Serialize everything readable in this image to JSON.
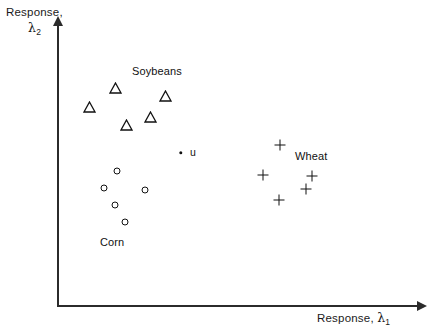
{
  "chart_data": {
    "type": "scatter",
    "title": "",
    "xlabel": "Response, λ₁",
    "ylabel": "Response, λ₂",
    "axis": {
      "x_label_text": "Response,",
      "x_label_symbol": "λ",
      "x_label_subscript": "1",
      "y_label_text": "Response,",
      "y_label_symbol": "λ",
      "y_label_subscript": "2",
      "x_has_arrow": true,
      "y_has_arrow": true,
      "ticks": [],
      "tick_labels": [],
      "grid": false,
      "xlim": [
        0,
        100
      ],
      "ylim": [
        0,
        100
      ]
    },
    "legend": {
      "position": "inline-annotations",
      "entries": [
        {
          "name": "Soybeans",
          "marker": "triangle"
        },
        {
          "name": "Corn",
          "marker": "circle"
        },
        {
          "name": "Wheat",
          "marker": "plus"
        }
      ]
    },
    "series": [
      {
        "name": "Soybeans",
        "marker": "triangle",
        "label": "Soybeans",
        "label_x": 132,
        "label_y": 65,
        "points": [
          {
            "x": 115,
            "y": 88
          },
          {
            "x": 89,
            "y": 107
          },
          {
            "x": 165,
            "y": 96
          },
          {
            "x": 150,
            "y": 117
          },
          {
            "x": 126,
            "y": 125
          }
        ]
      },
      {
        "name": "Corn",
        "marker": "circle",
        "label": "Corn",
        "label_x": 100,
        "label_y": 236,
        "points": [
          {
            "x": 117,
            "y": 171
          },
          {
            "x": 104,
            "y": 188
          },
          {
            "x": 145,
            "y": 190
          },
          {
            "x": 115,
            "y": 205
          },
          {
            "x": 125,
            "y": 222
          }
        ]
      },
      {
        "name": "Wheat",
        "marker": "plus",
        "label": "Wheat",
        "label_x": 295,
        "label_y": 150,
        "points": [
          {
            "x": 280,
            "y": 145
          },
          {
            "x": 263,
            "y": 175
          },
          {
            "x": 312,
            "y": 176
          },
          {
            "x": 306,
            "y": 189
          },
          {
            "x": 279,
            "y": 200
          }
        ]
      },
      {
        "name": "u",
        "marker": "dot",
        "label": "u",
        "label_x": 190,
        "label_y": 146,
        "points": [
          {
            "x": 181,
            "y": 153
          }
        ]
      }
    ],
    "colors": {
      "axis": "#2b2b2b",
      "marker": "#111111",
      "text": "#111111",
      "background": "#ffffff"
    }
  }
}
